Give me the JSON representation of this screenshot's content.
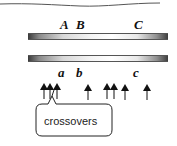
{
  "diagram": {
    "type": "chromosome crossover diagram",
    "upper_labels": [
      {
        "text": "A",
        "x": 60
      },
      {
        "text": "B",
        "x": 76
      },
      {
        "text": "C",
        "x": 134
      }
    ],
    "lower_labels": [
      {
        "text": "a",
        "x": 58
      },
      {
        "text": "b",
        "x": 76
      },
      {
        "text": "c",
        "x": 133
      }
    ],
    "chromosomes": [
      {
        "name": "upper-chromosome",
        "y": 33
      },
      {
        "name": "lower-chromosome",
        "y": 55
      }
    ],
    "arrow_positions_x": [
      44,
      50,
      57,
      88,
      107,
      114,
      125,
      147
    ],
    "callout": {
      "text": "crossovers"
    },
    "colors": {
      "chromosome_dark": "#3a3a3a",
      "chromosome_light": "#ffffff",
      "ink": "#111111"
    }
  }
}
